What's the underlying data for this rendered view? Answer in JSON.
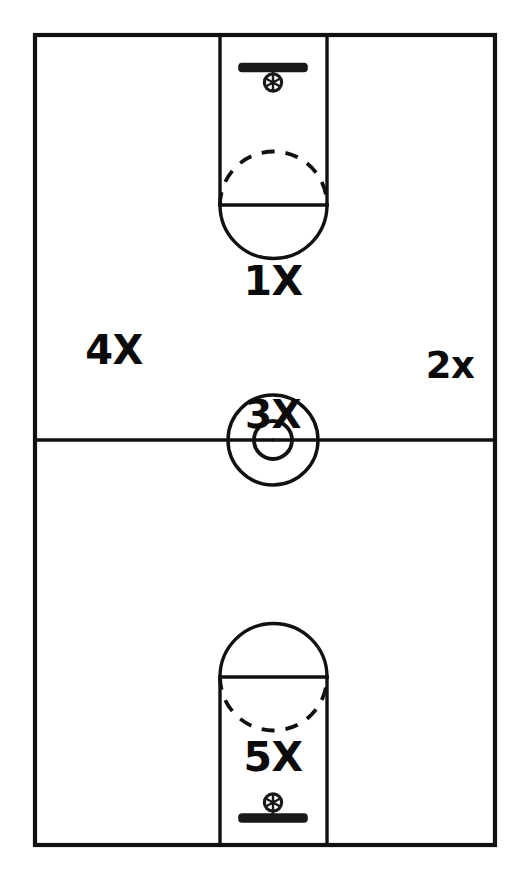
{
  "diagram": {
    "style": "hand-drawn line diagram",
    "background_color": "#ffffff",
    "line_color": "#111111",
    "canvas": {
      "width": 527,
      "height": 894
    }
  },
  "court": {
    "boundary": {
      "x": 35,
      "y": 35,
      "width": 460,
      "height": 810
    },
    "midcourt_line_y": 440,
    "center_circle": {
      "cx": 273,
      "cy": 440,
      "outer_radius": 45,
      "inner_radius": 19
    },
    "keys": [
      {
        "id": "top-key",
        "left": 220,
        "right": 327,
        "baseline_y": 35,
        "free_throw_line_y": 205
      },
      {
        "id": "bottom-key",
        "left": 220,
        "right": 327,
        "baseline_y": 845,
        "free_throw_line_y": 677
      }
    ],
    "hoops": [
      {
        "id": "top-hoop",
        "cx": 273,
        "backboard_y": 68,
        "rim_cy": 82,
        "backboard_width": 68
      },
      {
        "id": "bottom-hoop",
        "cx": 273,
        "backboard_y": 818,
        "rim_cy": 803,
        "backboard_width": 68
      }
    ]
  },
  "labels": {
    "zone_1": "1X",
    "zone_2": "2x",
    "zone_3": "3X",
    "zone_4": "4X",
    "zone_5": "5X"
  },
  "icons": {
    "top_backboard": "backboard-icon",
    "top_rim": "basketball-hoop-icon",
    "bottom_backboard": "backboard-icon",
    "bottom_rim": "basketball-hoop-icon"
  }
}
